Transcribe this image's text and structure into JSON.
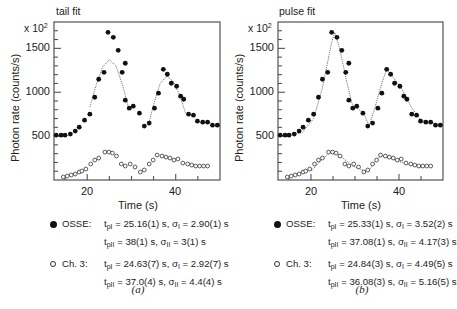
{
  "panels": [
    {
      "id": "a",
      "title": "tail fit",
      "multiplier": "x 10",
      "multiplier_exp": "2",
      "ylabel": "Photon rate (counts/s)",
      "xlabel": "Time (s)",
      "caption": "(a)",
      "yticks": [
        "1500",
        "1000",
        "500"
      ],
      "xticks": [
        "20",
        "40"
      ],
      "legend": [
        {
          "marker": "filled",
          "name": "OSSE:",
          "line1": {
            "tpI": "25.16(1) s",
            "sigI": "2.90(1) s"
          },
          "line2": {
            "tpII": "38(1) s",
            "sigII": "3(1) s"
          }
        },
        {
          "marker": "open",
          "name": "Ch. 3:",
          "line1": {
            "tpI": "24.63(7) s",
            "sigI": "2.92(7) s"
          },
          "line2": {
            "tpII": "37.0(4) s",
            "sigII": "4.4(4) s"
          }
        }
      ]
    },
    {
      "id": "b",
      "title": "pulse fit",
      "multiplier": "x 10",
      "multiplier_exp": "2",
      "ylabel": "Photon rate (counts/s)",
      "xlabel": "Time (s)",
      "caption": "(b)",
      "yticks": [
        "1500",
        "1000",
        "500"
      ],
      "xticks": [
        "20",
        "40"
      ],
      "legend": [
        {
          "marker": "filled",
          "name": "OSSE:",
          "line1": {
            "tpI": "25.33(1) s",
            "sigI": "3.52(2) s"
          },
          "line2": {
            "tpII": "37.08(1) s",
            "sigII": "4.17(3) s"
          }
        },
        {
          "marker": "open",
          "name": "Ch. 3:",
          "line1": {
            "tpI": "24.84(3) s",
            "sigI": "4.49(5) s"
          },
          "line2": {
            "tpII": "36.08(3) s",
            "sigII": "5.16(5) s"
          }
        }
      ]
    }
  ],
  "labels": {
    "t": "t",
    "sigma": "σ",
    "sub_pI": "pI",
    "sub_pII": "pII",
    "sub_I": "I",
    "sub_II": "II",
    "eq": " = ",
    "sep": ", "
  },
  "chart_data": [
    {
      "type": "scatter",
      "title": "tail fit",
      "xlabel": "Time (s)",
      "ylabel": "Photon rate (counts/s)",
      "xlim": [
        12.5,
        50
      ],
      "ylim": [
        0,
        1800
      ],
      "xticks": [
        20,
        40
      ],
      "yticks": [
        500,
        1000,
        1500
      ],
      "grid": false,
      "series": [
        {
          "name": "OSSE",
          "marker": "filled",
          "x": [
            13.0,
            14.1,
            15.0,
            16.2,
            17.3,
            18.2,
            19.4,
            20.6,
            21.7,
            22.6,
            23.8,
            24.7,
            25.9,
            27.0,
            27.9,
            28.6,
            28.6,
            29.5,
            30.4,
            31.8,
            32.9,
            34.0,
            35.2,
            36.1,
            37.2,
            38.1,
            39.0,
            40.2,
            41.1,
            41.8,
            42.9,
            44.0,
            44.9,
            46.1,
            47.2,
            48.3,
            49.4
          ],
          "y": [
            511,
            511,
            511,
            523,
            557,
            602,
            682,
            750,
            943,
            1148,
            1227,
            1682,
            1625,
            1477,
            1227,
            1330,
            909,
            818,
            841,
            761,
            614,
            648,
            818,
            989,
            1261,
            1205,
            1102,
            1068,
            955,
            920,
            750,
            739,
            670,
            659,
            659,
            625,
            625
          ]
        },
        {
          "name": "Ch. 3",
          "marker": "open",
          "x": [
            14.6,
            15.5,
            16.4,
            17.3,
            18.2,
            18.8,
            19.7,
            20.8,
            21.7,
            22.6,
            24.0,
            24.9,
            25.7,
            26.6,
            27.7,
            28.6,
            29.7,
            30.8,
            32.0,
            32.9,
            34.0,
            34.9,
            35.8,
            36.9,
            37.8,
            38.7,
            39.6,
            40.5,
            41.6,
            42.7,
            43.6,
            44.5,
            45.4,
            46.3,
            47.2
          ],
          "y": [
            34,
            45,
            57,
            68,
            91,
            102,
            125,
            182,
            227,
            250,
            318,
            318,
            307,
            273,
            182,
            159,
            182,
            148,
            91,
            114,
            182,
            227,
            284,
            273,
            261,
            250,
            227,
            239,
            193,
            182,
            170,
            159,
            159,
            159,
            159
          ]
        },
        {
          "name": "OSSE fit (tail, peak I)",
          "type": "line",
          "x": [
            20.6,
            22.0,
            23.5,
            25.0,
            26.5,
            28.0,
            29.3
          ],
          "y": [
            830,
            1080,
            1290,
            1370,
            1300,
            1080,
            830
          ]
        },
        {
          "name": "OSSE fit (tail, peak II)",
          "type": "line",
          "x": [
            33.8,
            35.0,
            36.5,
            38.0,
            39.5,
            41.0,
            42.3
          ],
          "y": [
            620,
            860,
            1100,
            1185,
            1120,
            950,
            750
          ]
        }
      ]
    },
    {
      "type": "scatter",
      "title": "pulse fit",
      "xlabel": "Time (s)",
      "ylabel": "Photon rate (counts/s)",
      "xlim": [
        12.5,
        50
      ],
      "ylim": [
        0,
        1800
      ],
      "xticks": [
        20,
        40
      ],
      "yticks": [
        500,
        1000,
        1500
      ],
      "grid": false,
      "series": [
        {
          "name": "OSSE",
          "marker": "filled",
          "same_as_panel_a": true
        },
        {
          "name": "Ch. 3",
          "marker": "open",
          "same_as_panel_a": true
        },
        {
          "name": "OSSE pulse fit",
          "type": "line",
          "x": [
            13,
            18,
            20.6,
            22.6,
            24.7,
            25.4,
            26.5,
            28.0,
            29.3,
            30.4,
            32.0,
            33.2,
            34.5,
            36.1,
            37.2,
            38.5,
            40.5,
            42.9,
            45.0,
            49.4
          ],
          "y": [
            505,
            540,
            700,
            1050,
            1570,
            1680,
            1500,
            1150,
            870,
            820,
            760,
            615,
            820,
            1100,
            1262,
            1180,
            1050,
            820,
            680,
            625
          ]
        },
        {
          "name": "Ch. 3 pulse fit",
          "type": "line",
          "x": [
            20,
            22,
            24,
            24.8,
            26,
            28,
            29.5,
            30.5,
            32.3,
            33.5,
            35,
            36.1,
            38,
            40,
            42,
            44,
            45.5
          ],
          "y": [
            100,
            210,
            300,
            320,
            300,
            220,
            160,
            140,
            100,
            130,
            240,
            275,
            250,
            210,
            180,
            150,
            140
          ]
        }
      ]
    }
  ]
}
